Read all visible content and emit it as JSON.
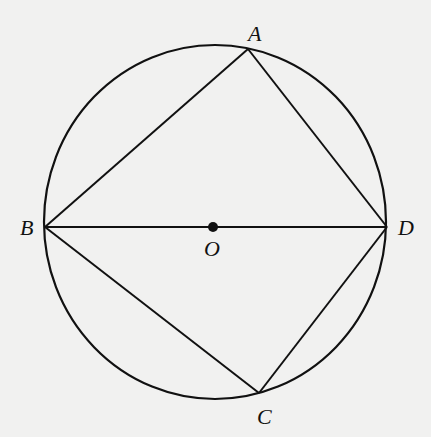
{
  "diagram": {
    "type": "inscribed-quadrilateral",
    "colors": {
      "background": "#f1f1f0",
      "stroke": "#111111"
    },
    "circle": {
      "cx": 215,
      "cy": 222,
      "rx": 171,
      "ry": 177
    },
    "points": {
      "A": {
        "x": 248,
        "y": 49
      },
      "B": {
        "x": 45,
        "y": 227
      },
      "C": {
        "x": 259,
        "y": 393
      },
      "D": {
        "x": 387,
        "y": 227
      },
      "O": {
        "x": 213,
        "y": 227
      }
    },
    "segments": [
      [
        "A",
        "B"
      ],
      [
        "A",
        "D"
      ],
      [
        "B",
        "D"
      ],
      [
        "B",
        "C"
      ],
      [
        "C",
        "D"
      ]
    ],
    "labels": {
      "A": "A",
      "B": "B",
      "C": "C",
      "D": "D",
      "O": "O"
    }
  }
}
